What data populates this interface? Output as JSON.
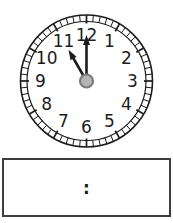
{
  "clock": {
    "numerals": [
      "1",
      "2",
      "3",
      "4",
      "5",
      "6",
      "7",
      "8",
      "9",
      "10",
      "11",
      "12"
    ],
    "hour": 11,
    "minute": 0,
    "stroke_color": "#1c1c1c",
    "face_color": "#ffffff",
    "center_dot_fill": "#b5b5b5",
    "center_dot_stroke": "#7d7d7d"
  },
  "answer_box": {
    "separator": ":"
  }
}
